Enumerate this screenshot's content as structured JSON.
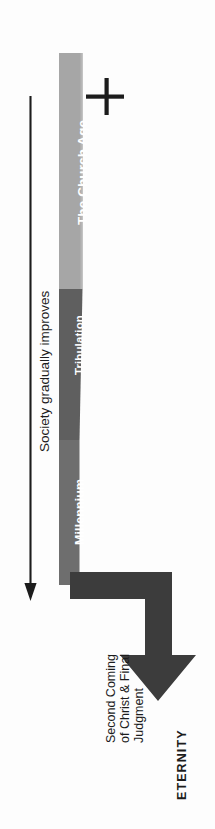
{
  "diagram": {
    "orientation": "rotated-90-ccw",
    "background_color": "#fdfdfd"
  },
  "timeline": {
    "bands": [
      {
        "id": "church-age",
        "label": "The Church Age",
        "color": "#a6a6a6",
        "text_color": "#ffffff"
      },
      {
        "id": "tribulation",
        "label": "Tribulation",
        "color": "#5f5f5f",
        "text_color": "#ffffff"
      },
      {
        "id": "millennium",
        "label": "Millennium",
        "color": "#6e6e6e",
        "text_color": "#ffffff"
      }
    ]
  },
  "annotations": {
    "cross_icon": "cross-icon",
    "society_arrow": {
      "label": "Society gradually improves",
      "color": "#1c1c1c",
      "direction": "down"
    },
    "eternity_arrow": {
      "label": "ETERNITY",
      "color": "#3c3c3c",
      "direction": "down"
    },
    "second_coming": {
      "lines": [
        "Second Coming",
        "of Christ & Final",
        "Judgment"
      ],
      "color": "#1c1c1c"
    }
  },
  "colors": {
    "light_gray": "#a6a6a6",
    "mid_gray": "#6e6e6e",
    "dark_gray": "#5f5f5f",
    "arrow_gray": "#3c3c3c",
    "ink": "#1c1c1c",
    "white": "#ffffff"
  }
}
